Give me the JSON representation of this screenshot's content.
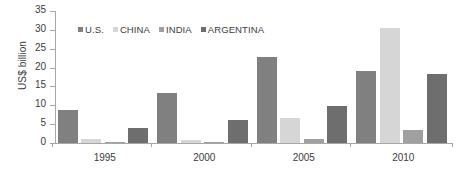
{
  "chart_data": {
    "type": "bar",
    "title": "",
    "subtitle": "",
    "xlabel": "",
    "ylabel": "US$ billion",
    "categories": [
      "1995",
      "2000",
      "2005",
      "2010"
    ],
    "series": [
      {
        "name": "U.S.",
        "color": "#808080",
        "values": [
          8.7,
          13.3,
          22.8,
          19.2
        ]
      },
      {
        "name": "CHINA",
        "color": "#d6d6d6",
        "values": [
          1.0,
          0.8,
          6.7,
          30.6
        ]
      },
      {
        "name": "INDIA",
        "color": "#a0a0a0",
        "values": [
          0.1,
          0.1,
          1.1,
          3.4
        ]
      },
      {
        "name": "ARGENTINA",
        "color": "#6e6e6e",
        "values": [
          4.1,
          6.2,
          9.8,
          18.2
        ]
      }
    ],
    "ylim": [
      0,
      35
    ],
    "yticks": [
      0,
      5,
      10,
      15,
      20,
      25,
      30,
      35
    ],
    "ytick_labels": [
      "0",
      "5",
      "10",
      "15",
      "20",
      "25",
      "30",
      "35"
    ],
    "grid": false,
    "legend_position": "top-left-inside",
    "axis_color": "#a8a8a8",
    "text_color": "#3d3d3d",
    "background": "#ffffff"
  }
}
